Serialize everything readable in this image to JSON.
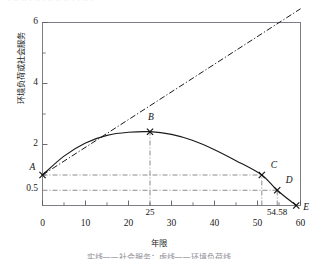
{
  "figure": {
    "top_remnant": "· ·· ·· · ·· · ·· ·· ·· · · ·· ·",
    "caption": "实线——社会服务；虚线——环境负荷线"
  },
  "chart_data": {
    "type": "line",
    "title": "",
    "xlabel": "年限",
    "ylabel": "环境负荷或社会服务",
    "xlim": [
      0,
      60
    ],
    "ylim": [
      0,
      6
    ],
    "grid": false,
    "legend": "none",
    "x_ticks": [
      0,
      10,
      20,
      30,
      40,
      50,
      60
    ],
    "x_tick_labels": [
      "0",
      "10",
      "20",
      "30",
      "40",
      "50",
      "60"
    ],
    "x_minor_ticks": [
      5,
      15,
      25,
      35,
      45,
      55
    ],
    "y_ticks": [
      2,
      4,
      6
    ],
    "y_tick_labels": [
      "2",
      "4",
      "6"
    ],
    "y_special_ticks": [
      {
        "value": 0.5,
        "label": "0.5"
      }
    ],
    "x_special_ticks": [
      {
        "value": 25,
        "label": "25"
      },
      {
        "value": 54.58,
        "label": "54.58"
      }
    ],
    "series": [
      {
        "name": "社会服务",
        "style": "solid",
        "color": "#1a1a1a",
        "description": "倒U型抛物线，峰值在x=25",
        "points": [
          [
            0,
            1.0
          ],
          [
            5,
            1.62
          ],
          [
            10,
            2.05
          ],
          [
            15,
            2.3
          ],
          [
            20,
            2.4
          ],
          [
            25,
            2.42
          ],
          [
            30,
            2.33
          ],
          [
            35,
            2.13
          ],
          [
            40,
            1.83
          ],
          [
            45,
            1.47
          ],
          [
            51,
            1.0
          ],
          [
            54.58,
            0.5
          ],
          [
            59,
            0.0
          ]
        ]
      },
      {
        "name": "环境负荷",
        "style": "dash-dot",
        "color": "#1a1a1a",
        "description": "从A点出发的上升直线",
        "points": [
          [
            0,
            1.0
          ],
          [
            60,
            6.45
          ]
        ]
      }
    ],
    "markers": [
      {
        "label": "A",
        "x": 0,
        "y": 1.0,
        "marker": "x",
        "label_dx": -11,
        "label_dy": -6
      },
      {
        "label": "B",
        "x": 25,
        "y": 2.42,
        "marker": "x",
        "label_dx": 0,
        "label_dy": -13
      },
      {
        "label": "C",
        "x": 51,
        "y": 1.0,
        "marker": "x",
        "label_dx": 11,
        "label_dy": -8
      },
      {
        "label": "D",
        "x": 54.58,
        "y": 0.5,
        "marker": "x",
        "label_dx": 11,
        "label_dy": -8
      },
      {
        "label": "E",
        "x": 59,
        "y": 0.0,
        "marker": "x",
        "label_dx": 9,
        "label_dy": 3
      }
    ],
    "guide_lines": [
      {
        "orientation": "vertical",
        "at": 25,
        "from": 0,
        "to": 2.42,
        "style": "dash-dot"
      },
      {
        "orientation": "vertical",
        "at": 51,
        "from": 0,
        "to": 1.0,
        "style": "dash-dot"
      },
      {
        "orientation": "vertical",
        "at": 54.58,
        "from": 0,
        "to": 0.5,
        "style": "dash-dot"
      },
      {
        "orientation": "horizontal",
        "at": 1.0,
        "from": 0,
        "to": 51,
        "style": "dash-dot"
      },
      {
        "orientation": "horizontal",
        "at": 0.5,
        "from": 0,
        "to": 54.58,
        "style": "dash-dot"
      }
    ]
  }
}
